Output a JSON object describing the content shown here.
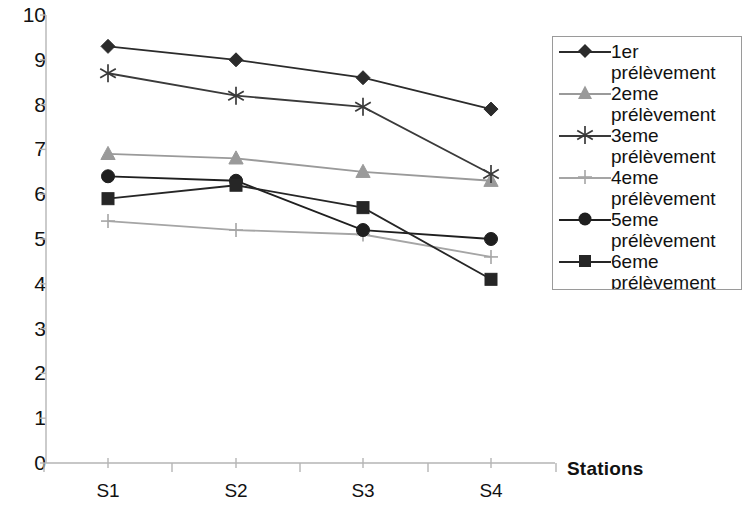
{
  "chart_data": {
    "type": "line",
    "title": "",
    "xlabel": "Stations",
    "ylabel": "",
    "categories": [
      "S1",
      "S2",
      "S3",
      "S4"
    ],
    "ylim": [
      0,
      10
    ],
    "ytick_labels": [
      "0",
      "1",
      "2",
      "3",
      "4",
      "5",
      "6",
      "7",
      "8",
      "9",
      "10"
    ],
    "ytick_values": [
      0,
      1,
      2,
      3,
      4,
      5,
      6,
      7,
      8,
      9,
      10
    ],
    "grid": false,
    "legend_position": "right",
    "series": [
      {
        "name": "1er prélèvement",
        "marker": "diamond",
        "color": "#2b2b2b",
        "values": [
          9.3,
          9.0,
          8.6,
          7.9
        ]
      },
      {
        "name": "2eme prélèvement",
        "marker": "triangle",
        "color": "#9a9a9a",
        "values": [
          6.9,
          6.8,
          6.5,
          6.3
        ]
      },
      {
        "name": "3eme prélèvement",
        "marker": "asterisk",
        "color": "#3a3a3a",
        "values": [
          8.7,
          8.2,
          7.95,
          6.45
        ]
      },
      {
        "name": "4eme prélèvement",
        "marker": "plus",
        "color": "#a5a5a5",
        "values": [
          5.4,
          5.2,
          5.1,
          4.6
        ]
      },
      {
        "name": "5eme prélèvement",
        "marker": "circle",
        "color": "#1f1f1f",
        "values": [
          6.4,
          6.3,
          5.2,
          5.0
        ]
      },
      {
        "name": "6eme prélèvement",
        "marker": "square",
        "color": "#262626",
        "values": [
          5.9,
          6.2,
          5.7,
          4.1
        ]
      }
    ]
  },
  "axes": {
    "x_axis_title": "Stations",
    "axis_color": "#b5b5b5"
  }
}
